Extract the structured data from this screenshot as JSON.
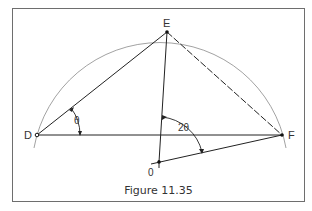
{
  "figure": {
    "caption": "Figure 11.35",
    "points": {
      "E": {
        "label": "E",
        "x": 167,
        "y": 32
      },
      "D": {
        "label": "D",
        "x": 37,
        "y": 135
      },
      "F": {
        "label": "F",
        "x": 282,
        "y": 135
      },
      "O": {
        "label": "0",
        "x": 159,
        "y": 162
      }
    },
    "angles": {
      "theta": "θ",
      "two_theta": "2θ"
    },
    "colors": {
      "line": "#222222",
      "arc": "#8a8a8a",
      "frame": "#6e6e6e"
    }
  }
}
